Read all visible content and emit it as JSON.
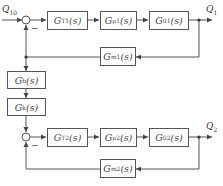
{
  "diagram": {
    "type": "block-diagram",
    "signals": {
      "input": {
        "name": "Q",
        "sub": "10"
      },
      "output1": {
        "name": "Q",
        "sub": "1"
      },
      "output2": {
        "name": "Q",
        "sub": "2"
      }
    },
    "sum_signs": {
      "loop1_feedback": "−",
      "loop2_feedback": "−"
    },
    "blocks": {
      "gt1": {
        "name": "G",
        "sub": "T1",
        "arg": "(s)"
      },
      "gu1": {
        "name": "G",
        "sub": "μ1",
        "arg": "(s)"
      },
      "g01": {
        "name": "G",
        "sub": "01",
        "arg": "(s)"
      },
      "gm1": {
        "name": "G",
        "sub": "m1",
        "arg": "(s)"
      },
      "gb": {
        "name": "G",
        "sub": "b",
        "arg": "(s)"
      },
      "gk": {
        "name": "G",
        "sub": "k",
        "arg": "(s)"
      },
      "gt2": {
        "name": "G",
        "sub": "T2",
        "arg": "(s)"
      },
      "gu2": {
        "name": "G",
        "sub": "μ2",
        "arg": "(s)"
      },
      "g02": {
        "name": "G",
        "sub": "02",
        "arg": "(s)"
      },
      "gm2": {
        "name": "G",
        "sub": "m2",
        "arg": "(s)"
      }
    },
    "colors": {
      "line": "#555555",
      "text": "#444444"
    }
  }
}
